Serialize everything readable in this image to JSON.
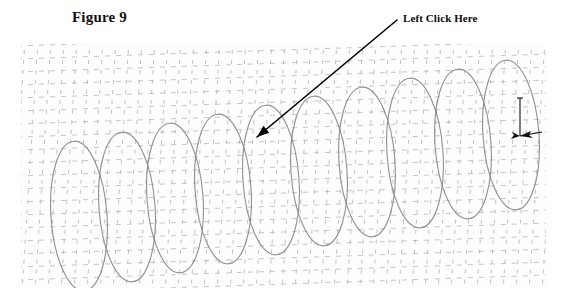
{
  "document": {
    "figure_caption": "Figure 9",
    "background_color": "#ffffff"
  },
  "annotation": {
    "label": "Left Click Here",
    "arrow_color": "#000000",
    "arrow_start": {
      "x": 397,
      "y": 20
    },
    "arrow_end": {
      "x": 257,
      "y": 137
    },
    "points_to": "helix-coil-5"
  },
  "figure": {
    "name": "3D helix over perspective grid",
    "frame": {
      "x": 21,
      "y": 44,
      "width": 525,
      "height": 244
    },
    "background_color": "#fdfdfd",
    "grid": {
      "style": "dashed",
      "color": "#a8a8a8",
      "cell_size": 13,
      "rows": 19,
      "cols": 41,
      "skew_note": "perspective-sheared mesh rising to the right"
    },
    "helix": {
      "color": "#8a8a8a",
      "line_width": 1.1,
      "coil_count": 10,
      "coil_width": 56,
      "coil_height": 150,
      "first_coil_center_x": 58,
      "coil_spacing": 48,
      "rise_per_coil": -9,
      "start_center_y": 172,
      "tilt_degrees": -4
    },
    "axis_indicator": {
      "name": "3d-axis-arrows",
      "color": "#111111",
      "x": 520,
      "y": 98,
      "vertical_length": 38,
      "horizontal_length": 22
    }
  }
}
